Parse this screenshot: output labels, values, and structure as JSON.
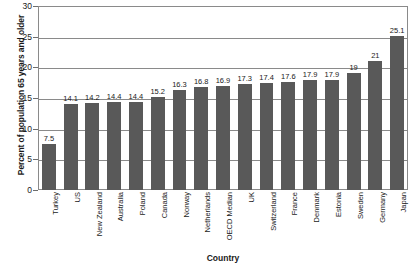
{
  "chart_data": {
    "type": "bar",
    "title": "",
    "xlabel": "Country",
    "ylabel": "Percent of population 65 years and older",
    "ylim": [
      0,
      30
    ],
    "yticks": [
      0,
      5,
      10,
      15,
      20,
      25,
      30
    ],
    "grid": true,
    "legend": "none",
    "bar_color": "#595959",
    "categories": [
      "Turkey",
      "US",
      "New Zealand",
      "Australia",
      "Poland",
      "Canada",
      "Norway",
      "Netherlands",
      "OECD Median",
      "UK",
      "Switzerland",
      "France",
      "Denmark",
      "Estonia",
      "Sweden",
      "Germany",
      "Japan"
    ],
    "values": [
      7.5,
      14.1,
      14.2,
      14.4,
      14.4,
      15.2,
      16.3,
      16.8,
      16.9,
      17.3,
      17.4,
      17.6,
      17.9,
      17.9,
      19,
      21,
      25.1
    ],
    "value_labels": [
      "7.5",
      "14.1",
      "14.2",
      "14.4",
      "14.4",
      "15.2",
      "16.3",
      "16.8",
      "16.9",
      "17.3",
      "17.4",
      "17.6",
      "17.9",
      "17.9",
      "19",
      "21",
      "25.1"
    ],
    "ytick_labels": [
      "0",
      "5",
      "10",
      "15",
      "20",
      "25",
      "30"
    ]
  }
}
